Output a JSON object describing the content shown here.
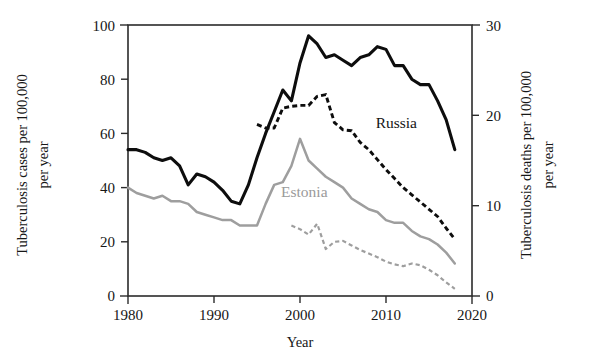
{
  "chart_data": {
    "type": "line",
    "title": "",
    "xlabel": "Year",
    "ylabel": "Tuberculosis cases per 100,000 per year",
    "ylabel_right": "Tuberculosis deaths per 100,000 per year",
    "xlim": [
      1980,
      2020
    ],
    "ylim": [
      0,
      100
    ],
    "ylim_right": [
      0,
      30
    ],
    "xticks": [
      1980,
      1990,
      2000,
      2010,
      2020
    ],
    "yticks": [
      0,
      20,
      40,
      60,
      80,
      100
    ],
    "yticks_right": [
      0,
      10,
      20,
      30
    ],
    "grid": false,
    "legend": "inline-annotations",
    "annotations": [
      {
        "text": "Russia",
        "x": 2011.2,
        "y": 62.0,
        "color": "#141414"
      },
      {
        "text": "Estonia",
        "x": 2000.5,
        "y": 36.5,
        "color": "#9a9a9a"
      }
    ],
    "series": [
      {
        "name": "Russia",
        "measure": "cases",
        "axis": "left",
        "style": "solid",
        "color": "#0d0d0d",
        "x": [
          1980,
          1981,
          1982,
          1983,
          1984,
          1985,
          1986,
          1987,
          1988,
          1989,
          1990,
          1991,
          1992,
          1993,
          1994,
          1995,
          1996,
          1997,
          1998,
          1999,
          2000,
          2001,
          2002,
          2003,
          2004,
          2005,
          2006,
          2007,
          2008,
          2009,
          2010,
          2011,
          2012,
          2013,
          2014,
          2015,
          2016,
          2017,
          2018
        ],
        "values": [
          54,
          54,
          53,
          51,
          50,
          51,
          48,
          41,
          45,
          44,
          42,
          39,
          35,
          34,
          41,
          51,
          60,
          68,
          76,
          72,
          86,
          96,
          93,
          88,
          89,
          87,
          85,
          88,
          89,
          92,
          91,
          85,
          85,
          80,
          78,
          78,
          72,
          65,
          54
        ]
      },
      {
        "name": "Estonia",
        "measure": "cases",
        "axis": "left",
        "style": "solid",
        "color": "#9e9e9e",
        "x": [
          1980,
          1981,
          1982,
          1983,
          1984,
          1985,
          1986,
          1987,
          1988,
          1989,
          1990,
          1991,
          1992,
          1993,
          1994,
          1995,
          1996,
          1997,
          1998,
          1999,
          2000,
          2001,
          2002,
          2003,
          2004,
          2005,
          2006,
          2007,
          2008,
          2009,
          2010,
          2011,
          2012,
          2013,
          2014,
          2015,
          2016,
          2017,
          2018
        ],
        "values": [
          40,
          38,
          37,
          36,
          37,
          35,
          35,
          34,
          31,
          30,
          29,
          28,
          28,
          26,
          26,
          26,
          34,
          41,
          42,
          48,
          58,
          50,
          47,
          44,
          42,
          40,
          36,
          34,
          32,
          31,
          28,
          27,
          27,
          24,
          22,
          21,
          19,
          16,
          12
        ]
      },
      {
        "name": "Russia",
        "measure": "deaths",
        "axis": "right",
        "style": "dashed",
        "color": "#0d0d0d",
        "x": [
          1995,
          1996,
          1997,
          1998,
          1999,
          2000,
          2001,
          2002,
          2003,
          2004,
          2005,
          2006,
          2007,
          2008,
          2009,
          2010,
          2011,
          2012,
          2013,
          2014,
          2015,
          2016,
          2017,
          2018
        ],
        "values": [
          19.0,
          18.6,
          18.6,
          20.8,
          21.0,
          21.1,
          21.1,
          22.1,
          22.3,
          19.2,
          18.4,
          18.3,
          17.0,
          16.2,
          15.1,
          14.0,
          13.0,
          12.0,
          11.2,
          10.4,
          9.6,
          8.8,
          7.5,
          6.3
        ]
      },
      {
        "name": "Estonia",
        "measure": "deaths",
        "axis": "right",
        "style": "dashed",
        "color": "#9e9e9e",
        "x": [
          1999,
          2000,
          2001,
          2002,
          2003,
          2004,
          2005,
          2006,
          2007,
          2008,
          2009,
          2010,
          2011,
          2012,
          2013,
          2014,
          2015,
          2016,
          2017,
          2018
        ],
        "values": [
          7.8,
          7.4,
          6.8,
          8.0,
          5.2,
          6.0,
          6.1,
          5.6,
          5.1,
          4.7,
          4.3,
          3.8,
          3.5,
          3.3,
          3.6,
          3.4,
          2.9,
          2.3,
          1.5,
          0.8
        ]
      }
    ]
  },
  "axes": {
    "left_title_line1": "Tuberculosis cases per 100,000",
    "left_title_line2": "per year",
    "right_title_line1": "Tuberculosis deaths per 100,000",
    "right_title_line2": "per year",
    "x_title": "Year",
    "xtick_labels": [
      "1980",
      "1990",
      "2000",
      "2010",
      "2020"
    ],
    "ytick_labels_left": [
      "0",
      "20",
      "40",
      "60",
      "80",
      "100"
    ],
    "ytick_labels_right": [
      "0",
      "10",
      "20",
      "30"
    ]
  },
  "labels": {
    "russia": "Russia",
    "estonia": "Estonia"
  }
}
